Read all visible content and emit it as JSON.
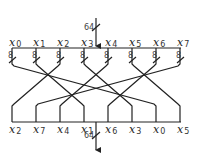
{
  "diagram": {
    "type": "bit-permutation-network",
    "input_bus": {
      "label": "64",
      "x": 96,
      "y_start": 18,
      "y_end": 48
    },
    "output_bus": {
      "label": "64",
      "x": 96,
      "y_start": 122,
      "y_end": 150
    },
    "top_bus_y": 48,
    "bottom_bus_y": 122,
    "column_x": [
      12,
      36,
      60,
      84,
      108,
      132,
      156,
      180
    ],
    "branch_width_label": "8",
    "inputs": [
      {
        "var": "x",
        "sub": "0",
        "to": 6
      },
      {
        "var": "x",
        "sub": "1",
        "to": 3
      },
      {
        "var": "x",
        "sub": "2",
        "to": 0
      },
      {
        "var": "x",
        "sub": "3",
        "to": 5
      },
      {
        "var": "x",
        "sub": "4",
        "to": 2
      },
      {
        "var": "x",
        "sub": "5",
        "to": 7
      },
      {
        "var": "x",
        "sub": "6",
        "to": 4
      },
      {
        "var": "x",
        "sub": "7",
        "to": 1
      }
    ],
    "outputs": [
      {
        "var": "x",
        "sub": "2"
      },
      {
        "var": "x",
        "sub": "7"
      },
      {
        "var": "x",
        "sub": "4"
      },
      {
        "var": "x",
        "sub": "1"
      },
      {
        "var": "x",
        "sub": "6"
      },
      {
        "var": "x",
        "sub": "3"
      },
      {
        "var": "x",
        "sub": "0"
      },
      {
        "var": "x",
        "sub": "5"
      }
    ]
  }
}
